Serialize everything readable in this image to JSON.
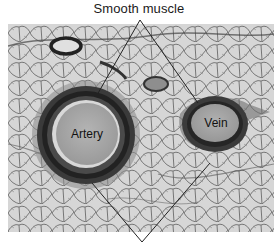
{
  "figure": {
    "label": "Smooth muscle",
    "vessels": [
      {
        "name": "Artery",
        "label": "Artery"
      },
      {
        "name": "Vein",
        "label": "Vein"
      }
    ],
    "tissue": "adipose connective tissue (micrograph)"
  },
  "colors": {
    "background": "#ffffff",
    "tissue": "#cfcfcf",
    "cell_border": "#555555",
    "vessel_wall": "#2b2b2b",
    "lumen": "#a8a8a8",
    "leader_line": "#222222"
  }
}
